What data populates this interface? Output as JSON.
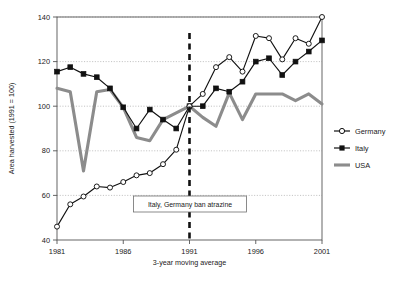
{
  "chart_data": {
    "type": "line",
    "title": "",
    "xlabel": "3-year moving average",
    "ylabel": "Area harvested (1991 = 100)",
    "xlim": [
      1981,
      2001
    ],
    "ylim": [
      40,
      140
    ],
    "xticks": [
      1981,
      1986,
      1991,
      1996,
      2001
    ],
    "yticks": [
      40,
      60,
      80,
      100,
      120,
      140
    ],
    "xtick_labels": [
      "1981",
      "1986",
      "1991",
      "1996",
      "2001"
    ],
    "ytick_labels": [
      "40",
      "60",
      "80",
      "100",
      "120",
      "140"
    ],
    "grid": "horizontal-dotted",
    "legend_position": "right",
    "x": [
      1981,
      1982,
      1983,
      1984,
      1985,
      1986,
      1987,
      1988,
      1989,
      1990,
      1991,
      1992,
      1993,
      1994,
      1995,
      1996,
      1997,
      1998,
      1999,
      2000,
      2001
    ],
    "series": [
      {
        "name": "Germany",
        "marker": "open-circle",
        "color": "#111111",
        "values": [
          46,
          56,
          59.5,
          64,
          63.5,
          66,
          69,
          70,
          74,
          80.5,
          100,
          105.5,
          117.5,
          122,
          115.5,
          131.5,
          130.5,
          121,
          130.5,
          128,
          140
        ]
      },
      {
        "name": "Italy",
        "marker": "filled-square",
        "color": "#111111",
        "values": [
          115.5,
          117.5,
          114.5,
          113,
          108,
          99.5,
          90,
          98.5,
          94,
          90,
          100,
          100,
          108,
          106.5,
          111,
          120,
          121.5,
          114,
          120,
          124.5,
          129.5
        ]
      },
      {
        "name": "USA",
        "marker": "none",
        "color": "#8c8c8c",
        "values": [
          108,
          106.5,
          71,
          106.5,
          107.5,
          99.5,
          86,
          84.5,
          94,
          97,
          100,
          95,
          91,
          106,
          94,
          105.5,
          105.5,
          105.5,
          102.5,
          105.5,
          101
        ]
      }
    ],
    "annotations": [
      {
        "text": "Italy, Germany ban atrazine",
        "x": 1991,
        "type": "vertical-dashed-line-with-box",
        "line_style": "dashed",
        "line_color": "#111111"
      }
    ]
  },
  "legend": {
    "items": [
      {
        "label": "Germany",
        "marker": "open-circle"
      },
      {
        "label": "Italy",
        "marker": "filled-square"
      },
      {
        "label": "USA",
        "marker": "thick-line"
      }
    ]
  }
}
